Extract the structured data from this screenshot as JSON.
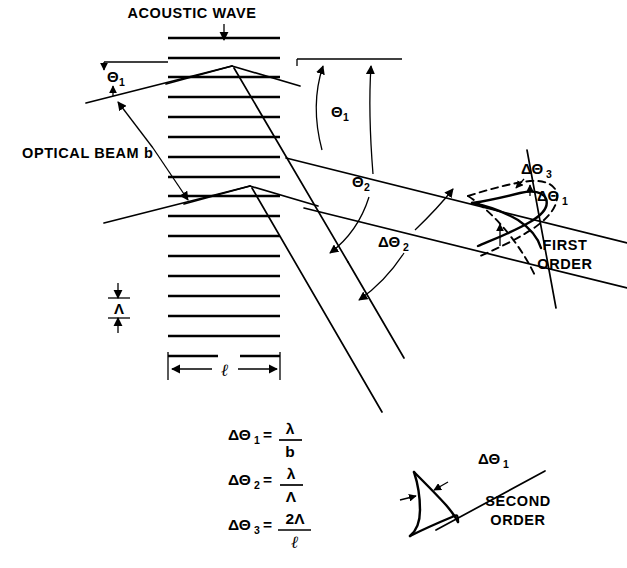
{
  "figure": {
    "title": "ACOUSTIC WAVE",
    "background_color": "#ffffff",
    "ink_color": "#000000",
    "width": 627,
    "height": 568
  },
  "labels": {
    "acoustic_wave": "ACOUSTIC WAVE",
    "optical_beam": "OPTICAL BEAM b",
    "first_order_line1": "FIRST",
    "first_order_line2": "ORDER",
    "second_order_line1": "SECOND",
    "second_order_line2": "ORDER",
    "grating_period_symbol": "Λ",
    "interaction_length_symbol": "ℓ"
  },
  "angles": {
    "theta1_left": {
      "symbol": "Θ",
      "subscript": "1"
    },
    "theta1_right": {
      "symbol": "Θ",
      "subscript": "1"
    },
    "theta2": {
      "symbol": "Θ",
      "subscript": "2"
    },
    "delta_theta2": {
      "prefix": "ΔΘ",
      "subscript": "2"
    },
    "delta_theta1_first": {
      "prefix": "ΔΘ",
      "subscript": "1"
    },
    "delta_theta3_first": {
      "prefix": "ΔΘ",
      "subscript": "3"
    },
    "delta_theta1_second": {
      "prefix": "ΔΘ",
      "subscript": "1"
    }
  },
  "equations": [
    {
      "id": "eq-delta-theta-1",
      "lhs_symbol": "ΔΘ",
      "lhs_subscript": "1",
      "equals": "=",
      "numerator": "λ",
      "denominator": "b"
    },
    {
      "id": "eq-delta-theta-2",
      "lhs_symbol": "ΔΘ",
      "lhs_subscript": "2",
      "equals": "=",
      "numerator": "λ",
      "denominator": "Λ"
    },
    {
      "id": "eq-delta-theta-3",
      "lhs_symbol": "ΔΘ",
      "lhs_subscript": "3",
      "equals": "=",
      "numerator": "2Λ",
      "denominator": "ℓ"
    }
  ],
  "grating": {
    "line_count": 17,
    "left_x": 168,
    "right_x": 280,
    "top_y": 38,
    "spacing": 19.8
  }
}
